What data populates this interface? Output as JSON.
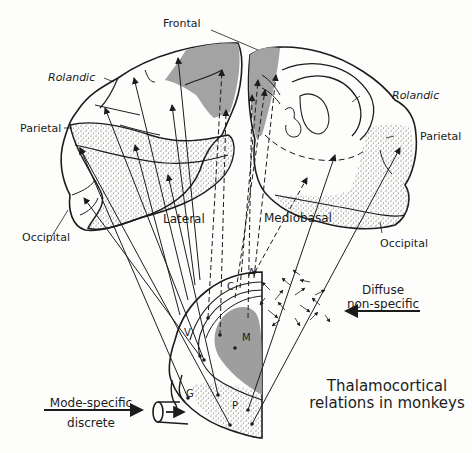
{
  "figure": {
    "title_line1": "Thalamocortical",
    "title_line2": "relations in monkeys"
  },
  "cortex_labels": {
    "frontal": "Frontal",
    "rolandic_left": "Rolandic",
    "rolandic_right": "Rolandic",
    "parietal_left": "Parietal",
    "parietal_right": "Parietal",
    "occipital_left": "Occipital",
    "occipital_right": "Occipital",
    "lateral": "Lateral",
    "mediobasal": "Mediobasal"
  },
  "thalamus_labels": {
    "anterior": "A",
    "caudate": "C",
    "medial": "M",
    "ventral": "V",
    "geniculate": "G",
    "pulvinar": "P"
  },
  "inputs": {
    "diffuse_line1": "Diffuse",
    "diffuse_line2": "non-specific",
    "mode_line1": "Mode-specific",
    "mode_line2": "discrete",
    "cut_marker": "-"
  },
  "colors": {
    "ink": "#1c1c1c",
    "shade": "#9e9e9e",
    "stipple": "#555555",
    "paper": "#fdfdfc"
  }
}
